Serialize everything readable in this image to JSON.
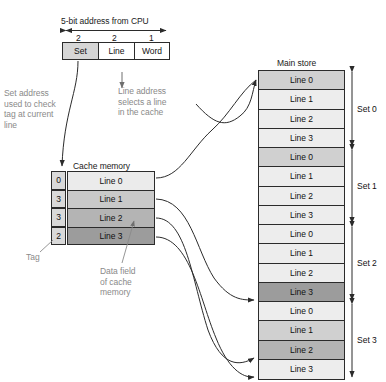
{
  "address": {
    "title": "5-bit address from CPU",
    "bits": [
      "2",
      "2",
      "1"
    ],
    "fields": [
      {
        "label": "Set",
        "shaded": true
      },
      {
        "label": "Line",
        "shaded": false
      },
      {
        "label": "Word",
        "shaded": false
      }
    ]
  },
  "annotations": {
    "set_note": "Set address\nused to check\ntag at current\nline",
    "line_note": "Line address\nselects a line\nin the cache",
    "tag_label": "Tag",
    "data_field_note": "Data field\nof cache\nmemory"
  },
  "cache": {
    "title": "Cache memory",
    "rows": [
      {
        "tag": "0",
        "line": "Line 0",
        "shade": "#ebebeb"
      },
      {
        "tag": "3",
        "line": "Line 1",
        "shade": "#c9c9c9"
      },
      {
        "tag": "3",
        "line": "Line 2",
        "shade": "#b4b4b4"
      },
      {
        "tag": "2",
        "line": "Line 3",
        "shade": "#9c9c9c"
      }
    ]
  },
  "main_store": {
    "title": "Main store",
    "rows": [
      {
        "line": "Line 0",
        "shade": "#d0d0d0"
      },
      {
        "line": "Line 1",
        "shade": "#ededed"
      },
      {
        "line": "Line 2",
        "shade": "#ededed"
      },
      {
        "line": "Line 3",
        "shade": "#ededed"
      },
      {
        "line": "Line 0",
        "shade": "#d0d0d0"
      },
      {
        "line": "Line 1",
        "shade": "#ededed"
      },
      {
        "line": "Line 2",
        "shade": "#ededed"
      },
      {
        "line": "Line 3",
        "shade": "#ededed"
      },
      {
        "line": "Line 0",
        "shade": "#ededed"
      },
      {
        "line": "Line 1",
        "shade": "#ededed"
      },
      {
        "line": "Line 2",
        "shade": "#ededed"
      },
      {
        "line": "Line 3",
        "shade": "#9c9c9c"
      },
      {
        "line": "Line 0",
        "shade": "#ededed"
      },
      {
        "line": "Line 1",
        "shade": "#d0d0d0"
      },
      {
        "line": "Line 2",
        "shade": "#b4b4b4"
      },
      {
        "line": "Line 3",
        "shade": "#ededed"
      }
    ],
    "sets": [
      "Set 0",
      "Set 1",
      "Set 2",
      "Set 3"
    ]
  },
  "colors": {
    "stroke": "#2b2b2b",
    "gray_text": "#8a8a8a"
  }
}
